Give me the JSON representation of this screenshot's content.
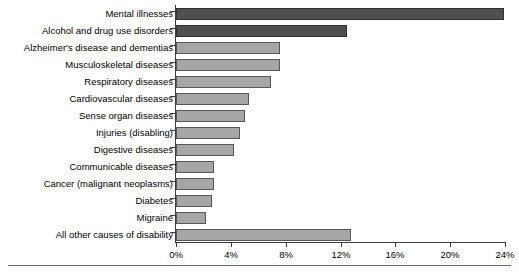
{
  "chart_data": {
    "type": "bar",
    "orientation": "horizontal",
    "title": "",
    "xlabel": "",
    "ylabel": "",
    "xlim": [
      0,
      24
    ],
    "xticks": [
      "0%",
      "4%",
      "8%",
      "12%",
      "16%",
      "20%",
      "24%"
    ],
    "xtick_values": [
      0,
      4,
      8,
      12,
      16,
      20,
      24
    ],
    "grid": false,
    "legend": "none",
    "categories": [
      "Mental illnesses",
      "Alcohol and drug use disorders",
      "Alzheimer's disease and dementias",
      "Musculoskeletal diseases",
      "Respiratory diseases",
      "Cardiovascular diseases",
      "Sense organ diseases",
      "Injuries (disabling)",
      "Digestive diseases",
      "Communicable diseases",
      "Cancer (malignant neoplasms)",
      "Diabetes",
      "Migraine",
      "All other causes of disability"
    ],
    "values": [
      23.9,
      12.5,
      7.6,
      7.6,
      6.9,
      5.3,
      5.0,
      4.7,
      4.2,
      2.8,
      2.8,
      2.6,
      2.2,
      12.8
    ],
    "bar_styles": [
      "dark",
      "dark",
      "light",
      "light",
      "light",
      "light",
      "light",
      "light",
      "light",
      "light",
      "light",
      "light",
      "light",
      "light"
    ],
    "colors": {
      "dark_bar_fill": "#4f4f4f",
      "dark_bar_stroke": "#2f2f2f",
      "light_bar_fill": "#a6a6a6",
      "light_bar_stroke": "#575757",
      "axis": "#3d3d3d",
      "text": "#000000",
      "background": "#ffffff",
      "bottom_rule": "#6b6b6b"
    }
  }
}
